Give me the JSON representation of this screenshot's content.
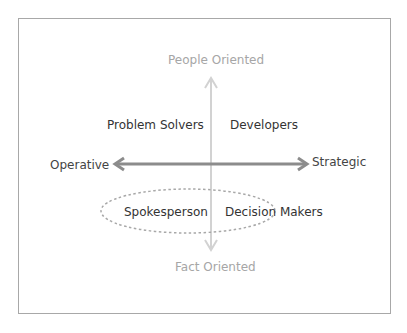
{
  "diagram": {
    "axes": {
      "vertical": {
        "top_label": "People Oriented",
        "bottom_label": "Fact Oriented",
        "color": "#cfcfcf"
      },
      "horizontal": {
        "left_label": "Operative",
        "right_label": "Strategic",
        "color": "#8c8c8c"
      }
    },
    "quadrants": {
      "top_left": "Problem Solvers",
      "top_right": "Developers",
      "bottom_left": "Spokesperson",
      "bottom_right": "Decision Makers"
    },
    "highlight": {
      "style": "dashed-ellipse",
      "color": "#a0a0a0",
      "encloses": [
        "Spokesperson",
        "Decision Makers"
      ]
    },
    "frame_color": "#a8a8a8"
  }
}
